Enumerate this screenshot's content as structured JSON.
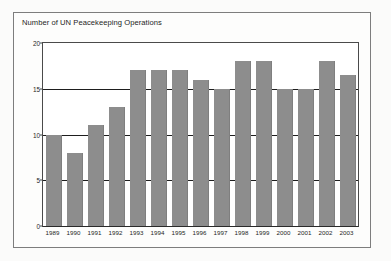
{
  "figure": {
    "title": "Number of UN Peacekeeping Operations"
  },
  "colors": {
    "bar_fill": "#8d8d8d",
    "gridline": "#1e1e1e",
    "axis": "#4a4a4a",
    "frame": "#7d7d7d",
    "text": "#242424",
    "plot_background": "#ffffff",
    "page_background": "#fbfbfa"
  },
  "chart_data": {
    "type": "bar",
    "title": "Number of UN Peacekeeping Operations",
    "xlabel": "",
    "ylabel": "",
    "categories": [
      "1989",
      "1990",
      "1991",
      "1992",
      "1993",
      "1994",
      "1995",
      "1996",
      "1997",
      "1998",
      "1999",
      "2000",
      "2001",
      "2002",
      "2003"
    ],
    "values": [
      10,
      8,
      11,
      13,
      17,
      17,
      17,
      16,
      15,
      18,
      18,
      15,
      15,
      18,
      16.5
    ],
    "ylim": [
      0,
      20
    ],
    "yticks": [
      0,
      5,
      10,
      15,
      20
    ],
    "ytick_labels": [
      "0",
      "5",
      "10",
      "15",
      "20"
    ],
    "gridlines": [
      5,
      10,
      15,
      20
    ],
    "grid": true,
    "legend": null,
    "legend_position": "none",
    "series": [
      {
        "name": "Number of UN Peacekeeping Operations",
        "values": [
          10,
          8,
          11,
          13,
          17,
          17,
          17,
          16,
          15,
          18,
          18,
          15,
          15,
          18,
          16.5
        ]
      }
    ]
  }
}
